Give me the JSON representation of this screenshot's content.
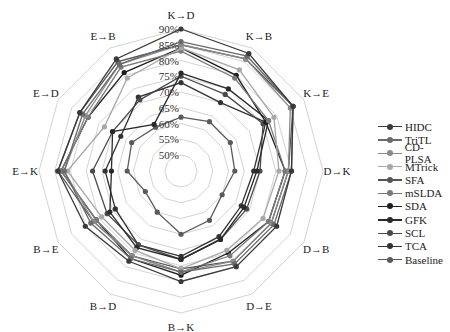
{
  "chart_data": {
    "type": "radar",
    "title": "",
    "axes": [
      "K→D",
      "K→B",
      "K→E",
      "D→K",
      "D→B",
      "D→E",
      "B→K",
      "B→D",
      "B→E",
      "E→K",
      "E→D",
      "E→B"
    ],
    "radial_ticks": [
      "50%",
      "55%",
      "60%",
      "65%",
      "70%",
      "75%",
      "80%",
      "85%",
      "90%"
    ],
    "radial_range": [
      50,
      90
    ],
    "grid": true,
    "legend_position": "right",
    "series": [
      {
        "name": "HIDC",
        "color": "#3a3a3a",
        "values": [
          90,
          88,
          86,
          80,
          80,
          80,
          80,
          78,
          80,
          84,
          82,
          86
        ]
      },
      {
        "name": "TriTL",
        "color": "#6a6a6a",
        "values": [
          86,
          87,
          86,
          80,
          79,
          79,
          77,
          77,
          78,
          82,
          81,
          84
        ]
      },
      {
        "name": "CD-PLSA",
        "color": "#8a8a8a",
        "values": [
          85,
          86,
          85,
          79,
          78,
          78,
          77,
          76,
          77,
          82,
          80,
          84
        ]
      },
      {
        "name": "MTrick",
        "color": "#a8a8a8",
        "values": [
          84,
          82,
          79,
          76,
          75,
          74,
          76,
          74,
          74,
          81,
          73,
          79
        ]
      },
      {
        "name": "SFA",
        "color": "#555555",
        "values": [
          85,
          86,
          86,
          79,
          78,
          78,
          76,
          76,
          77,
          84,
          82,
          85
        ]
      },
      {
        "name": "mSLDA",
        "color": "#7a7a7a",
        "values": [
          83,
          79,
          77,
          78,
          77,
          76,
          77,
          76,
          76,
          83,
          79,
          83
        ]
      },
      {
        "name": "SDA",
        "color": "#1e1e1e",
        "values": [
          84,
          80,
          76,
          78,
          77,
          75,
          78,
          77,
          76,
          83,
          79,
          81
        ]
      },
      {
        "name": "GFK",
        "color": "#2a2a2a",
        "values": [
          76,
          75,
          77,
          69,
          68,
          70,
          73,
          73,
          71,
          67,
          70,
          62
        ]
      },
      {
        "name": "SCL",
        "color": "#4a4a4a",
        "values": [
          75,
          73,
          75,
          70,
          69,
          70,
          73,
          72,
          72,
          73,
          70,
          71
        ]
      },
      {
        "name": "TCA",
        "color": "#333333",
        "values": [
          73,
          70,
          76,
          68,
          67,
          69,
          72,
          72,
          69,
          69,
          67,
          72
        ]
      },
      {
        "name": "Baseline",
        "color": "#5a5a5a",
        "values": [
          62,
          63,
          63,
          62,
          60,
          63,
          65,
          60,
          58,
          62,
          63,
          61
        ]
      }
    ]
  },
  "legend": {
    "items": [
      "HIDC",
      "TriTL",
      "CD-PLSA",
      "MTrick",
      "SFA",
      "mSLDA",
      "SDA",
      "GFK",
      "SCL",
      "TCA",
      "Baseline"
    ]
  }
}
